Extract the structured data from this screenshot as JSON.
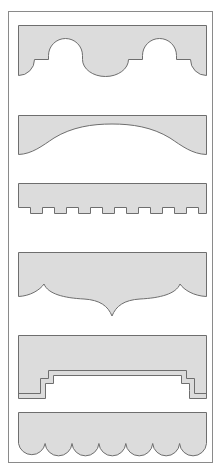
{
  "diagram": {
    "title": "",
    "colors": {
      "background": "#ffffff",
      "frame_stroke": "#8a8a8a",
      "shape_fill": "#dcdcdc",
      "shape_stroke": "#6e6e6e"
    },
    "shapes": [
      {
        "id": "arched-scallop-profile",
        "label": ""
      },
      {
        "id": "shallow-arch-profile",
        "label": ""
      },
      {
        "id": "crenellated-profile",
        "label": ""
      },
      {
        "id": "ogee-point-profile",
        "label": ""
      },
      {
        "id": "stepped-profile",
        "label": ""
      },
      {
        "id": "scalloped-edge-profile",
        "label": ""
      }
    ]
  }
}
